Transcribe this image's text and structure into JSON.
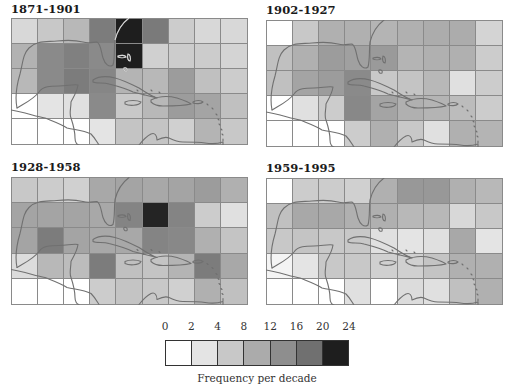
{
  "figure": {
    "panels": [
      {
        "title": "1871-1901",
        "cells": [
          [
            "#d8d8d8",
            "#c8c8c8",
            "#b8b8b8",
            "#7c7c7c",
            "#1e1e1e",
            "#7a7a7a",
            "#cccccc",
            "#d8d8d8",
            "#d8d8d8"
          ],
          [
            "#b2b2b2",
            "#8a8a8a",
            "#808080",
            "#8a8a8a",
            "#1e1e1e",
            "#d0d0d0",
            "#cccccc",
            "#cccccc",
            "#d4d4d4"
          ],
          [
            "#b8b8b8",
            "#8a8a8a",
            "#7c7c7c",
            "#868686",
            "#b4b4b4",
            "#b8b8b8",
            "#9c9c9c",
            "#c0c0c0",
            "#cccccc"
          ],
          [
            "#ffffff",
            "#e4e4e4",
            "#e0e0e0",
            "#8a8a8a",
            "#c8c8c8",
            "#b8b8b8",
            "#9c9c9c",
            "#a4a4a4",
            "#c0c0c0"
          ],
          [
            "#ffffff",
            "#ffffff",
            "#ffffff",
            "#e4e4e4",
            "#c4c4c4",
            "#c4c4c4",
            "#d0d0d0",
            "#b4b4b4",
            "#c8c8c8"
          ]
        ]
      },
      {
        "title": "1902-1927",
        "cells": [
          [
            "#ffffff",
            "#c8c8c8",
            "#b0b0b0",
            "#b0b0b0",
            "#b4b4b4",
            "#b0b0b0",
            "#acacac",
            "#acacac",
            "#d4d4d4"
          ],
          [
            "#c0c0c0",
            "#b0b0b0",
            "#9c9c9c",
            "#a0a0a0",
            "#9a9a9a",
            "#b4b4b4",
            "#b0b0b0",
            "#b0b0b0",
            "#cccccc"
          ],
          [
            "#c0c0c0",
            "#a4a4a4",
            "#9c9c9c",
            "#8a8a8a",
            "#c8c8c8",
            "#c4c4c4",
            "#b8b8b8",
            "#e0e0e0",
            "#cccccc"
          ],
          [
            "#ffffff",
            "#e0e0e0",
            "#cccccc",
            "#888888",
            "#a4a4a4",
            "#b0b0b0",
            "#b4b4b4",
            "#bcbcbc",
            "#cccccc"
          ],
          [
            "#ffffff",
            "#ffffff",
            "#ffffff",
            "#cccccc",
            "#b0b0b0",
            "#c8c8c8",
            "#e0e0e0",
            "#b0b0b0",
            "#b4b4b4"
          ]
        ]
      },
      {
        "title": "1928-1958",
        "cells": [
          [
            "#c8c8c8",
            "#cccccc",
            "#d0d0d0",
            "#a8a8a8",
            "#a4a4a4",
            "#a8a8a8",
            "#a4a4a4",
            "#9c9c9c",
            "#b0b0b0"
          ],
          [
            "#a4a4a4",
            "#a4a4a4",
            "#a4a4a4",
            "#a8a8a8",
            "#848484",
            "#242424",
            "#848484",
            "#cccccc",
            "#e0e0e0"
          ],
          [
            "#a4a4a4",
            "#7c7c7c",
            "#a4a4a4",
            "#a8a8a8",
            "#a8a8a8",
            "#848484",
            "#888888",
            "#b0b0b0",
            "#c4c4c4"
          ],
          [
            "#dcdcdc",
            "#b8b8b8",
            "#bcbcbc",
            "#7c7c7c",
            "#c0c0c0",
            "#c4c4c4",
            "#b4b4b4",
            "#7c7c7c",
            "#a8a8a8"
          ],
          [
            "#ffffff",
            "#ffffff",
            "#ffffff",
            "#cccccc",
            "#c4c4c4",
            "#c8c8c8",
            "#d0d0d0",
            "#b0b0b0",
            "#c0c0c0"
          ]
        ]
      },
      {
        "title": "1959-1995",
        "cells": [
          [
            "#ffffff",
            "#cccccc",
            "#cccccc",
            "#d0d0d0",
            "#b0b0b0",
            "#989898",
            "#989898",
            "#b0b0b0",
            "#b8b8b8"
          ],
          [
            "#c0c0c0",
            "#a8a8a8",
            "#a8a8a8",
            "#b0b0b0",
            "#b0b0b0",
            "#b8b8b8",
            "#b8b8b8",
            "#d8d8d8",
            "#c8c8c8"
          ],
          [
            "#c8c8c8",
            "#c4c4c4",
            "#c8c8c8",
            "#c8c8c8",
            "#e0e0e0",
            "#e4e4e4",
            "#e0e0e0",
            "#a8a8a8",
            "#e4e4e4"
          ],
          [
            "#f4f4f4",
            "#e4e4e4",
            "#c8c8c8",
            "#c8c8c8",
            "#d0d0d0",
            "#d0d0d0",
            "#c4c4c4",
            "#b0b0b0",
            "#b0b0b0"
          ],
          [
            "#ffffff",
            "#ffffff",
            "#ffffff",
            "#e0e0e0",
            "#ffffff",
            "#dcdcdc",
            "#e0e0e0",
            "#c0c0c0",
            "#b0b0b0"
          ]
        ]
      }
    ],
    "legend": {
      "ticks": [
        "0",
        "2",
        "4",
        "8",
        "12",
        "16",
        "20",
        "24"
      ],
      "colors": [
        "#ffffff",
        "#e4e4e4",
        "#c8c8c8",
        "#ababab",
        "#8e8e8e",
        "#707070",
        "#1e1e1e"
      ],
      "caption": "Frequency per decade"
    },
    "colors": {
      "coastline": "#707070",
      "coastline_on_dark": "#d8d8d8",
      "grid_line": "#8a8a8a"
    }
  }
}
